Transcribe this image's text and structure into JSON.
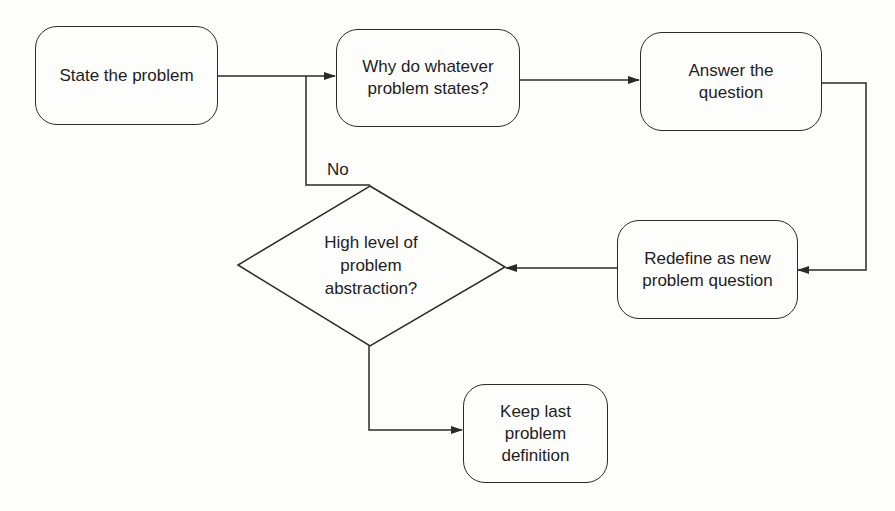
{
  "diagram": {
    "type": "flowchart",
    "nodes": {
      "state_problem": {
        "label": "State the problem",
        "shape": "rounded-rect"
      },
      "why_question": {
        "label": "Why do whatever\nproblem states?",
        "shape": "rounded-rect"
      },
      "answer_question": {
        "label": "Answer the\nquestion",
        "shape": "rounded-rect"
      },
      "redefine": {
        "label": "Redefine as new\nproblem question",
        "shape": "rounded-rect"
      },
      "decision": {
        "label": "High level of\nproblem\nabstraction?",
        "shape": "diamond"
      },
      "keep_last": {
        "label": "Keep last\nproblem\ndefinition",
        "shape": "rounded-rect"
      }
    },
    "edges": [
      {
        "from": "state_problem",
        "to": "why_question",
        "label": ""
      },
      {
        "from": "why_question",
        "to": "answer_question",
        "label": ""
      },
      {
        "from": "answer_question",
        "to": "redefine",
        "label": ""
      },
      {
        "from": "redefine",
        "to": "decision",
        "label": ""
      },
      {
        "from": "decision",
        "to": "why_question",
        "label": "No"
      },
      {
        "from": "decision",
        "to": "keep_last",
        "label": ""
      }
    ],
    "edge_labels": {
      "no": "No"
    },
    "colors": {
      "stroke": "#2a2a2a",
      "background": "#fdfdfb",
      "text": "#1e1e1e"
    }
  }
}
